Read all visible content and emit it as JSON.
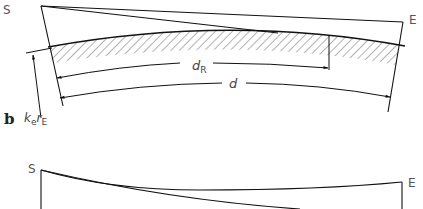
{
  "diagram": {
    "panel_a": {
      "start_label": "S",
      "end_label": "E",
      "reflection_distance_label": "d",
      "reflection_distance_sub": "R",
      "distance_label": "d",
      "radius_label_k": "k",
      "radius_label_k_sub": "e",
      "radius_label_r": "r",
      "radius_label_r_sub": "E"
    },
    "panel_b": {
      "panel_letter": "b",
      "start_label": "S",
      "end_label": "E"
    },
    "colors": {
      "line": "#1a1a1a",
      "hatch": "#555555",
      "text": "#555555"
    }
  }
}
